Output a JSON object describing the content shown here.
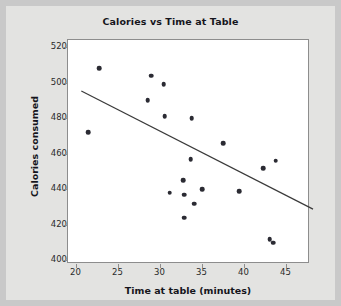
{
  "chart_data": {
    "type": "scatter",
    "title": "Calories vs Time at Table",
    "xlabel": "Time at table (minutes)",
    "ylabel": "Calories consumed",
    "xlim": [
      19.0,
      47.8
    ],
    "ylim": [
      398,
      524
    ],
    "xticks": [
      20,
      25,
      30,
      35,
      40,
      45
    ],
    "yticks": [
      400,
      420,
      440,
      460,
      480,
      500,
      520
    ],
    "grid": false,
    "legend": "none",
    "point_color": "#2b2b33",
    "line_color": "#3a3a3a",
    "x": [
      21.4,
      22.7,
      28.5,
      28.9,
      30.4,
      30.5,
      31.1,
      32.7,
      32.8,
      32.8,
      33.6,
      33.7,
      34.0,
      35.0,
      37.5,
      39.4,
      42.2,
      43.0,
      43.4,
      43.7
    ],
    "y": [
      472,
      508,
      490,
      504,
      499,
      481,
      438,
      445,
      437,
      424,
      457,
      480,
      432,
      440,
      466,
      439,
      452,
      412,
      410,
      456
    ],
    "points": [
      {
        "x": 21.4,
        "y": 472
      },
      {
        "x": 22.7,
        "y": 508
      },
      {
        "x": 28.5,
        "y": 490
      },
      {
        "x": 28.9,
        "y": 504
      },
      {
        "x": 30.4,
        "y": 499
      },
      {
        "x": 30.5,
        "y": 481
      },
      {
        "x": 31.1,
        "y": 438
      },
      {
        "x": 32.7,
        "y": 445
      },
      {
        "x": 32.8,
        "y": 437
      },
      {
        "x": 32.8,
        "y": 424
      },
      {
        "x": 33.6,
        "y": 457
      },
      {
        "x": 33.7,
        "y": 480
      },
      {
        "x": 34.0,
        "y": 432
      },
      {
        "x": 35.0,
        "y": 440
      },
      {
        "x": 37.5,
        "y": 466
      },
      {
        "x": 39.4,
        "y": 439
      },
      {
        "x": 42.2,
        "y": 452
      },
      {
        "x": 43.0,
        "y": 412
      },
      {
        "x": 43.4,
        "y": 410
      },
      {
        "x": 43.7,
        "y": 456
      }
    ],
    "trendline": {
      "type": "linear-fit",
      "x0": 20.6,
      "y0": 495,
      "x1": 48.4,
      "y1": 428
    }
  }
}
